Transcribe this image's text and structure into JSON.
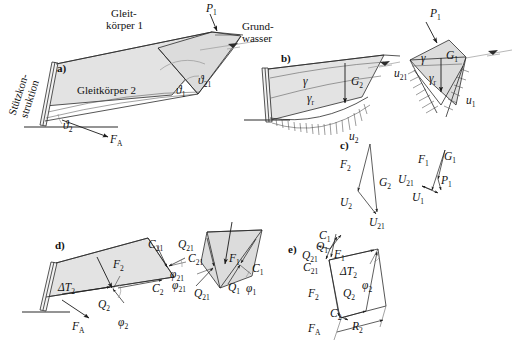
{
  "figure": {
    "domain": "engineering-diagram",
    "colors": {
      "soil_fill": "#e3e3e3",
      "soil_fill_alt": "#dcdcdc",
      "wall_fill": "#f2f2f2",
      "line": "#2b2b2b",
      "arc": "#8a8a8a",
      "waterline": "#9a9a9a"
    }
  },
  "panels": {
    "a": {
      "tag": "a)",
      "labels": {
        "support_structure_line1": "Stützkon-",
        "support_structure_line2": "struktion",
        "sliding_body_1_line1": "Gleit-",
        "sliding_body_1_line2": "körper 1",
        "sliding_body_2": "Gleitkörper 2",
        "groundwater_line1": "Grund-",
        "groundwater_line2": "wasser",
        "load_p1": "P",
        "load_p1_sub": "1",
        "force_fa": "F",
        "force_fa_sub": "A",
        "angle_theta2": "ϑ",
        "angle_theta2_sub": "2",
        "angle_theta1": "ϑ",
        "angle_theta1_sub": "1",
        "angle_theta21": "ϑ",
        "angle_theta21_sub": "21"
      }
    },
    "b": {
      "tag": "b)",
      "labels": {
        "gamma": "γ",
        "gamma_r": "γ",
        "gamma_r_sub": "r",
        "weight_g2": "G",
        "weight_g2_sub": "2",
        "pressure_u2": "u",
        "pressure_u2_sub": "2",
        "load_p1": "P",
        "load_p1_sub": "1",
        "gamma_right": "γ",
        "gamma_r_right": "γ",
        "gamma_r_right_sub": "r",
        "weight_g1": "G",
        "weight_g1_sub": "1",
        "pressure_u21": "u",
        "pressure_u21_sub": "21",
        "pressure_u1": "u",
        "pressure_u1_sub": "1"
      }
    },
    "c": {
      "tag": "c)",
      "labels": {
        "f2": "F",
        "f2_sub": "2",
        "g2": "G",
        "g2_sub": "2",
        "u2": "U",
        "u2_sub": "2",
        "u21_left": "U",
        "u21_left_sub": "21",
        "f1": "F",
        "f1_sub": "1",
        "g1": "G",
        "g1_sub": "1",
        "u21": "U",
        "u21_sub": "21",
        "p1": "P",
        "p1_sub": "1",
        "u1": "U",
        "u1_sub": "1"
      }
    },
    "d": {
      "tag": "d)",
      "labels": {
        "f2": "F",
        "f2_sub": "2",
        "delta_t2": "ΔT",
        "delta_t2_sub": "2",
        "fa": "F",
        "fa_sub": "A",
        "q2": "Q",
        "q2_sub": "2",
        "phi2": "φ",
        "phi2_sub": "2",
        "c2": "C",
        "c2_sub": "2",
        "c21": "C",
        "c21_sub": "21",
        "q21": "Q",
        "q21_sub": "21",
        "phi21": "φ",
        "phi21_sub": "21",
        "f1": "F",
        "f1_sub": "1",
        "c1": "C",
        "c1_sub": "1",
        "q1": "Q",
        "q1_sub": "1",
        "phi1": "φ",
        "phi1_sub": "1",
        "c21_wedge": "C",
        "c21_wedge_sub": "21",
        "q21_wedge": "Q",
        "q21_wedge_sub": "21",
        "phi21_wedge": "φ",
        "phi21_wedge_sub": "21"
      }
    },
    "e": {
      "tag": "e)",
      "labels": {
        "c1": "C",
        "c1_sub": "1",
        "q1": "Q",
        "q1_sub": "1",
        "q21": "Q",
        "q21_sub": "21",
        "c21": "C",
        "c21_sub": "21",
        "f1": "F",
        "f1_sub": "1",
        "delta_t2": "ΔT",
        "delta_t2_sub": "2",
        "phi2": "φ",
        "phi2_sub": "2",
        "f2": "F",
        "f2_sub": "2",
        "q2": "Q",
        "q2_sub": "2",
        "c2": "C",
        "c2_sub": "2",
        "fa": "F",
        "fa_sub": "A",
        "r2": "R",
        "r2_sub": "2"
      }
    }
  }
}
